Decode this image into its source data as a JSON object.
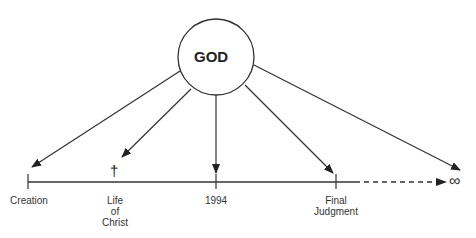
{
  "diagram": {
    "center_node": {
      "label": "GOD"
    },
    "timeline": {
      "points": [
        {
          "label": "Creation",
          "lines": [
            "Creation"
          ]
        },
        {
          "label": "Life of Christ",
          "lines": [
            "Life",
            "of",
            "Christ"
          ],
          "marker": "†"
        },
        {
          "label": "1994",
          "lines": [
            "1994"
          ]
        },
        {
          "label": "Final Judgment",
          "lines": [
            "Final",
            "Judgment"
          ]
        }
      ],
      "end_symbol": "∞"
    }
  }
}
